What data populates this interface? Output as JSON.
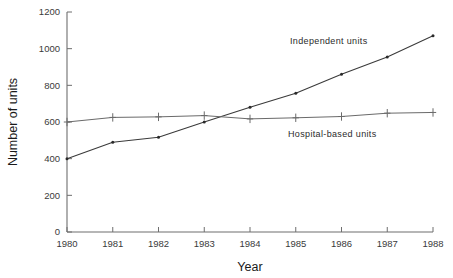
{
  "chart_data": {
    "type": "line",
    "title": "",
    "xlabel": "Year",
    "ylabel": "Number of units",
    "x": [
      1980,
      1981,
      1982,
      1983,
      1984,
      1985,
      1986,
      1987,
      1988
    ],
    "xticklabels": [
      "1980",
      "1981",
      "1982",
      "1983",
      "1984",
      "1985",
      "1986",
      "1987",
      "1988"
    ],
    "yticklabels": [
      "0",
      "200",
      "400",
      "600",
      "800",
      "1000",
      "1200"
    ],
    "yticks": [
      0,
      200,
      400,
      600,
      800,
      1000,
      1200
    ],
    "xlim": [
      1980,
      1988
    ],
    "ylim": [
      0,
      1200
    ],
    "grid": false,
    "legend_position": "inline-annotation",
    "series": [
      {
        "name": "Independent units",
        "marker": "dot",
        "color": "#2a2a2a",
        "values": [
          400,
          490,
          517,
          600,
          680,
          757,
          860,
          955,
          1070
        ]
      },
      {
        "name": "Hospital-based units",
        "marker": "plus",
        "color": "#6a6a6a",
        "values": [
          600,
          625,
          628,
          635,
          617,
          623,
          630,
          648,
          652
        ]
      }
    ],
    "annotations": [
      {
        "text": "Independent units",
        "x_px": 290,
        "y_px": 44
      },
      {
        "text": "Hospital-based units",
        "x_px": 288,
        "y_px": 137
      }
    ]
  },
  "layout": {
    "plot_left_px": 67,
    "plot_right_px": 433,
    "plot_top_px": 12,
    "plot_bottom_px": 232,
    "background": "#ffffff",
    "axis_color": "#6e6e6e"
  }
}
